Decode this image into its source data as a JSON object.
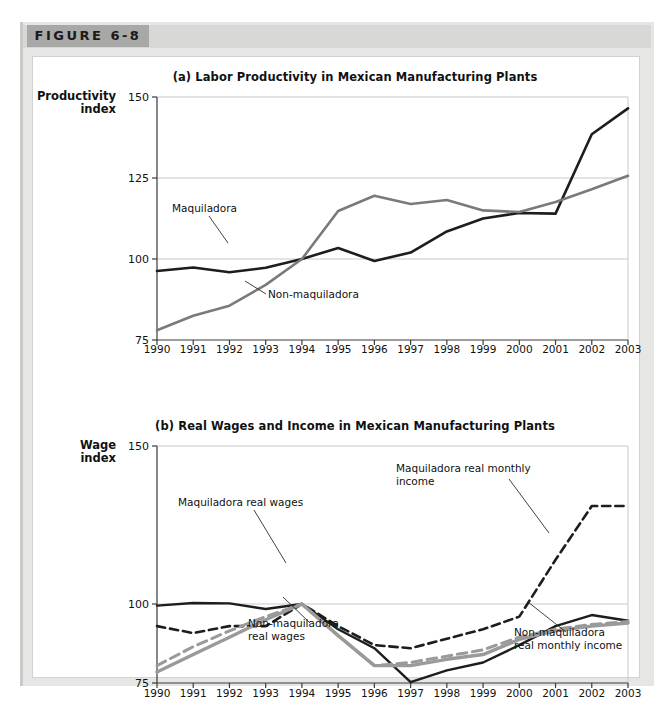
{
  "figure": {
    "tag": "FIGURE 6-8"
  },
  "chart_data": [
    {
      "id": "a",
      "type": "line",
      "title": "(a) Labor Productivity in Mexican Manufacturing Plants",
      "ylabel": "Productivity\nindex",
      "xlabel": "",
      "ylim": [
        75,
        150
      ],
      "yticks": [
        75,
        100,
        125,
        150
      ],
      "ytick_labels": [
        "75",
        "100",
        "125",
        "150"
      ],
      "grid": true,
      "legend_position": "inline-annotations",
      "categories": [
        1990,
        1991,
        1992,
        1993,
        1994,
        1995,
        1996,
        1997,
        1998,
        1999,
        2000,
        2001,
        2002,
        2003
      ],
      "tick_labels": [
        "1990",
        "1991",
        "1992",
        "1993",
        "1994",
        "1995",
        "1996",
        "1997",
        "1998",
        "1999",
        "2000",
        "2001",
        "2002",
        "2003"
      ],
      "series": [
        {
          "name": "Maquiladora",
          "style": "solid",
          "color": "#1d1d1d",
          "width": 2.6,
          "values": [
            96.3,
            97.4,
            95.9,
            97.3,
            100.0,
            103.4,
            99.4,
            102.0,
            108.5,
            112.5,
            114.2,
            114.0,
            138.5,
            146.5
          ]
        },
        {
          "name": "Non-maquiladora",
          "style": "solid",
          "color": "#7a7a7a",
          "width": 2.6,
          "values": [
            78.0,
            82.5,
            85.6,
            92.0,
            100.0,
            114.8,
            119.5,
            117.0,
            118.2,
            115.0,
            114.5,
            117.6,
            121.5,
            125.7
          ]
        }
      ],
      "annotations": [
        {
          "text": "Maquiladora",
          "x": 172,
          "y": 212
        },
        {
          "text": "Non-maquiladora",
          "x": 268,
          "y": 298
        }
      ]
    },
    {
      "id": "b",
      "type": "line",
      "title": "(b) Real Wages and Income in Mexican Manufacturing Plants",
      "ylabel": "Wage\nindex",
      "xlabel": "",
      "ylim": [
        75,
        150
      ],
      "yticks": [
        75,
        100,
        150
      ],
      "ytick_labels": [
        "75",
        "100",
        "150"
      ],
      "grid": true,
      "legend_position": "inline-annotations",
      "categories": [
        1990,
        1991,
        1992,
        1993,
        1994,
        1995,
        1996,
        1997,
        1998,
        1999,
        2000,
        2001,
        2002,
        2003
      ],
      "tick_labels": [
        "1990",
        "1991",
        "1992",
        "1993",
        "1994",
        "1995",
        "1996",
        "1997",
        "1998",
        "1999",
        "2000",
        "2001",
        "2002",
        "2003"
      ],
      "series": [
        {
          "name": "Maquiladora real wages",
          "style": "solid",
          "color": "#1d1d1d",
          "width": 2.4,
          "values": [
            99.5,
            100.3,
            100.2,
            98.4,
            100.0,
            92.0,
            86.0,
            75.3,
            79.0,
            81.5,
            87.0,
            93.0,
            96.5,
            94.7
          ]
        },
        {
          "name": "Maquiladora real monthly income",
          "style": "dashed",
          "color": "#1d1d1d",
          "width": 2.6,
          "values": [
            93.0,
            90.8,
            93.0,
            93.0,
            100.0,
            93.0,
            87.0,
            86.0,
            89.0,
            92.0,
            96.0,
            114.0,
            131.0,
            131.0
          ]
        },
        {
          "name": "Non-maquiladora real wages",
          "style": "solid",
          "color": "#9a9a9a",
          "width": 3.4,
          "values": [
            78.5,
            84.0,
            89.5,
            95.0,
            100.0,
            90.0,
            80.5,
            80.5,
            82.5,
            84.0,
            88.8,
            91.5,
            93.0,
            94.0
          ]
        },
        {
          "name": "Non-maquiladora real monthly income",
          "style": "dashed",
          "color": "#9a9a9a",
          "width": 3.0,
          "values": [
            80.5,
            86.5,
            91.5,
            96.0,
            100.0,
            90.0,
            80.5,
            81.5,
            83.5,
            85.5,
            89.5,
            92.0,
            93.5,
            94.5
          ]
        }
      ],
      "annotations": [
        {
          "text": "Maquiladora real wages",
          "x": 178,
          "y": 506
        },
        {
          "text": "Maquiladora real monthly",
          "x": 396,
          "y": 472
        },
        {
          "text": "income",
          "x": 396,
          "y": 485
        },
        {
          "text": "Non-maquiladora",
          "x": 248,
          "y": 627
        },
        {
          "text": "real wages",
          "x": 248,
          "y": 640
        },
        {
          "text": "Non-maquiladora",
          "x": 514,
          "y": 636
        },
        {
          "text": "real monthly income",
          "x": 514,
          "y": 649
        }
      ]
    }
  ]
}
